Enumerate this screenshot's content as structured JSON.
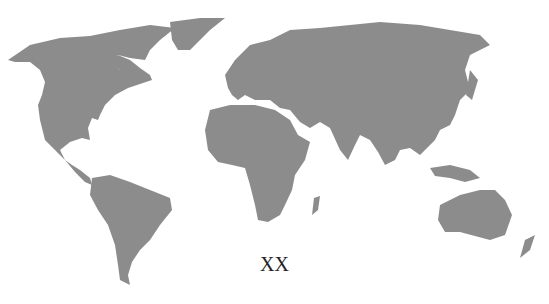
{
  "map": {
    "type": "world-map",
    "land_color": "#8c8c8c",
    "background_color": "#ffffff",
    "label": "XX"
  }
}
